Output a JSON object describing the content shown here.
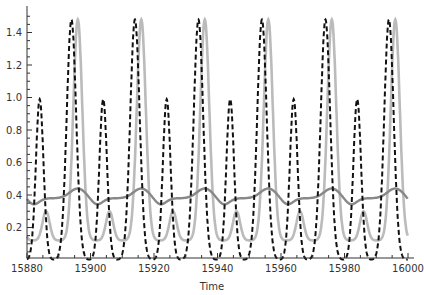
{
  "chart_data": {
    "type": "line",
    "title": "",
    "xlabel": "Time",
    "ylabel": "",
    "xlim": [
      15880,
      16000
    ],
    "ylim": [
      0,
      1.55
    ],
    "grid": false,
    "legend": null,
    "x_ticks": [
      15880,
      15900,
      15920,
      15940,
      15960,
      15980,
      16000
    ],
    "x_tick_labels": [
      "15880",
      "15900",
      "15920",
      "15940",
      "15960",
      "15980",
      "16000"
    ],
    "y_ticks": [
      0.2,
      0.4,
      0.6,
      0.8,
      1.0,
      1.2,
      1.4
    ],
    "y_tick_labels": [
      "0.2",
      "0.4",
      "0.6",
      "0.8",
      "1.0",
      "1.2",
      "1.4"
    ],
    "series": [
      {
        "name": "series-black-dashed",
        "style": "dashed",
        "color": "#111111",
        "period": 20,
        "small_peaks": {
          "x": [
            15884,
            15904,
            15924,
            15944,
            15964,
            15984
          ],
          "y": 0.99
        },
        "large_peaks": {
          "x": [
            15894,
            15914,
            15934,
            15954,
            15974,
            15994
          ],
          "y": 1.48
        },
        "minima": {
          "x": [
            15889,
            15899,
            15909,
            15919,
            15929,
            15939,
            15949,
            15959,
            15969,
            15979,
            15989,
            15999
          ],
          "y_deep": 0.0,
          "y_shallow": 0.12
        }
      },
      {
        "name": "series-light-gray",
        "style": "solid",
        "color": "#bbbbbb",
        "period": 20,
        "large_peaks": {
          "x": [
            15896,
            15916,
            15936,
            15956,
            15976,
            15996
          ],
          "y": 1.48
        },
        "small_peaks": {
          "x": [
            15886,
            15906,
            15926,
            15946,
            15966,
            15986
          ],
          "y": 0.3
        },
        "minima_y": 0.12
      },
      {
        "name": "series-medium-gray",
        "style": "solid",
        "color": "#888888",
        "period": 20,
        "peaks": {
          "x": [
            15896,
            15916,
            15936,
            15956,
            15976,
            15996
          ],
          "y": 0.44
        },
        "troughs": {
          "x": [
            15882,
            15902,
            15922,
            15942,
            15962,
            15982
          ],
          "y": 0.34
        },
        "plateau_y": 0.38
      }
    ]
  }
}
